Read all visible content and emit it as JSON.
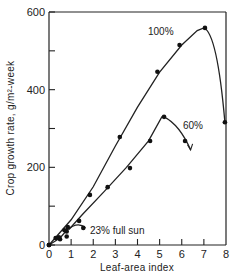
{
  "chart_data": {
    "type": "line",
    "title": "",
    "xlabel": "Leaf-area index",
    "ylabel": "Crop growth rate, g/m²-week",
    "xlim": [
      0,
      8
    ],
    "ylim": [
      0,
      600
    ],
    "xticks": [
      "0",
      "1",
      "2",
      "3",
      "4",
      "5",
      "6",
      "7",
      "8"
    ],
    "yticks": [
      "0",
      "200",
      "400",
      "600"
    ],
    "grid": false,
    "legend": "none (curves labeled inline)",
    "series": [
      {
        "name": "100%",
        "points": [
          [
            0,
            0
          ],
          [
            0.5,
            15
          ],
          [
            0.8,
            35
          ],
          [
            1.85,
            129
          ],
          [
            3.2,
            278
          ],
          [
            4.9,
            446
          ],
          [
            5.9,
            515
          ],
          [
            7.05,
            559
          ],
          [
            7.95,
            316
          ]
        ]
      },
      {
        "name": "60%",
        "points": [
          [
            0,
            0
          ],
          [
            1.36,
            62
          ],
          [
            2.65,
            149
          ],
          [
            3.66,
            198
          ],
          [
            4.57,
            268
          ],
          [
            5.2,
            330
          ],
          [
            6.15,
            268
          ]
        ]
      },
      {
        "name": "23% full sun",
        "points": [
          [
            0,
            0
          ],
          [
            0.3,
            18
          ],
          [
            0.45,
            20
          ],
          [
            0.7,
            38
          ],
          [
            0.85,
            46
          ],
          [
            0.8,
            22
          ],
          [
            1.55,
            44
          ]
        ]
      }
    ]
  },
  "labels": {
    "s100": "100%",
    "s60": "60%",
    "s23": "23% full sun",
    "xlabel": "Leaf-area index",
    "ylabel": "Crop growth rate, g/m²-week"
  }
}
